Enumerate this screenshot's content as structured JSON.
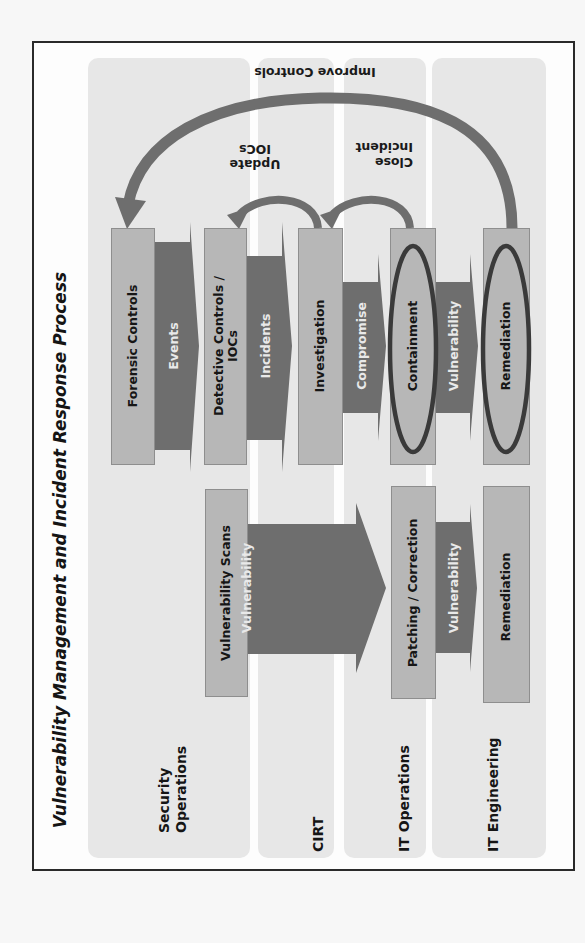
{
  "title": "Vulnerability Management and Incident Response Process",
  "colors": {
    "frame_border": "#2a2a2a",
    "lane_bg": "#e7e7e7",
    "box_fill": "#b7b7b7",
    "arrow_fill": "#6e6e6e",
    "ellipse_stroke": "#3a3a3a"
  },
  "lanes": [
    {
      "id": "security-operations",
      "label_line1": "Security",
      "label_line2": "Operations"
    },
    {
      "id": "cirt",
      "label": "CIRT"
    },
    {
      "id": "it-operations",
      "label": "IT Operations"
    },
    {
      "id": "it-engineering",
      "label": "IT Engineering"
    }
  ],
  "incident_response_flow": {
    "boxes": [
      {
        "id": "forensic-controls",
        "label": "Forensic Controls",
        "lane": "security-operations"
      },
      {
        "id": "detective-controls",
        "label_line1": "Detective Controls /",
        "label_line2": "IOCs",
        "lane": "security-operations"
      },
      {
        "id": "investigation",
        "label": "Investigation",
        "lane": "cirt"
      },
      {
        "id": "containment",
        "label": "Containment",
        "lane": "it-operations",
        "highlighted": true
      },
      {
        "id": "remediation",
        "label": "Remediation",
        "lane": "it-engineering",
        "highlighted": true
      }
    ],
    "arrows": [
      {
        "id": "events",
        "label": "Events",
        "from": "forensic-controls",
        "to": "detective-controls"
      },
      {
        "id": "incidents",
        "label": "Incidents",
        "from": "detective-controls",
        "to": "investigation"
      },
      {
        "id": "compromise",
        "label": "Compromise",
        "from": "investigation",
        "to": "containment"
      },
      {
        "id": "vulnerability",
        "label": "Vulnerability",
        "from": "containment",
        "to": "remediation"
      }
    ],
    "feedback_loops": [
      {
        "id": "update-iocs",
        "label_line1": "Update",
        "label_line2": "IOCs",
        "from": "investigation",
        "to": "detective-controls"
      },
      {
        "id": "close-incident",
        "label_line1": "Close",
        "label_line2": "Incident",
        "from": "containment",
        "to": "investigation"
      },
      {
        "id": "improve-controls",
        "label": "Improve Controls",
        "from": "remediation",
        "to": "forensic-controls"
      }
    ]
  },
  "vulnerability_management_flow": {
    "boxes": [
      {
        "id": "vulnerability-scans",
        "label": "Vulnerability Scans",
        "lane": "security-operations"
      },
      {
        "id": "patching-correction",
        "label": "Patching / Correction",
        "lane": "it-operations"
      },
      {
        "id": "remediation-vm",
        "label": "Remediation",
        "lane": "it-engineering"
      }
    ],
    "arrows": [
      {
        "id": "vulnerability-big",
        "label": "Vulnerability",
        "from": "vulnerability-scans",
        "to": "patching-correction"
      },
      {
        "id": "vulnerability-small",
        "label": "Vulnerability",
        "from": "patching-correction",
        "to": "remediation-vm"
      }
    ]
  }
}
